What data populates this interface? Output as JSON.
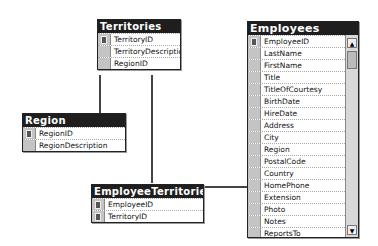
{
  "tables": {
    "territories": {
      "title": "Territories",
      "fields": [
        "TerritoryID",
        "TerritoryDescription",
        "RegionID"
      ],
      "keys": [
        0
      ]
    },
    "region": {
      "title": "Region",
      "fields": [
        "RegionID",
        "RegionDescription"
      ],
      "keys": [
        0
      ]
    },
    "employee_territories": {
      "title": "EmployeeTerritories",
      "fields": [
        "EmployeeID",
        "TerritoryID"
      ],
      "keys": [
        0,
        1
      ]
    },
    "employees": {
      "title": "Employees",
      "fields": [
        "EmployeeID",
        "LastName",
        "FirstName",
        "Title",
        "TitleOfCourtesy",
        "BirthDate",
        "HireDate",
        "Address",
        "City",
        "Region",
        "PostalCode",
        "Country",
        "HomePhone",
        "Extension",
        "Photo",
        "Notes",
        "ReportsTo"
      ],
      "keys": [
        0
      ]
    }
  },
  "scrollbar": {
    "up_icon": "▲",
    "down_icon": "▼"
  },
  "relationships": [
    {
      "from": "Region",
      "to": "Territories"
    },
    {
      "from": "Territories",
      "to": "EmployeeTerritories"
    },
    {
      "from": "Employees",
      "to": "EmployeeTerritories"
    }
  ]
}
